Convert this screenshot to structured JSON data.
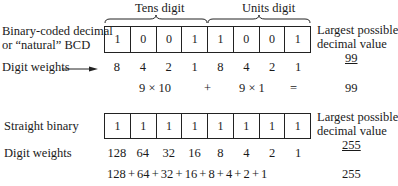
{
  "bcd": {
    "tens_label": "Tens digit",
    "units_label": "Units digit",
    "row_label_line1": "Binary-coded decimal",
    "row_label_line2": "or “natural” BCD",
    "bits": [
      "1",
      "0",
      "0",
      "1",
      "1",
      "0",
      "0",
      "1"
    ],
    "weights_label": "Digit weights",
    "weights": [
      "8",
      "4",
      "2",
      "1",
      "8",
      "4",
      "2",
      "1"
    ],
    "eq_tens": "9 × 10",
    "eq_plus": "+",
    "eq_units": "9 × 1",
    "eq_equals": "=",
    "eq_result": "99",
    "largest_line1": "Largest possible",
    "largest_line2": "decimal value",
    "largest_value": "99"
  },
  "binary": {
    "row_label": "Straight binary",
    "bits": [
      "1",
      "1",
      "1",
      "1",
      "1",
      "1",
      "1",
      "1"
    ],
    "weights_label": "Digit weights",
    "weights": [
      "128",
      "64",
      "32",
      "16",
      "8",
      "4",
      "2",
      "1"
    ],
    "sum_expression": "128 + 64 + 32 + 16 + 8 + 4 + 2 + 1",
    "sum_result": "255",
    "largest_line1": "Largest possible",
    "largest_line2": "decimal value",
    "largest_value": "255"
  }
}
